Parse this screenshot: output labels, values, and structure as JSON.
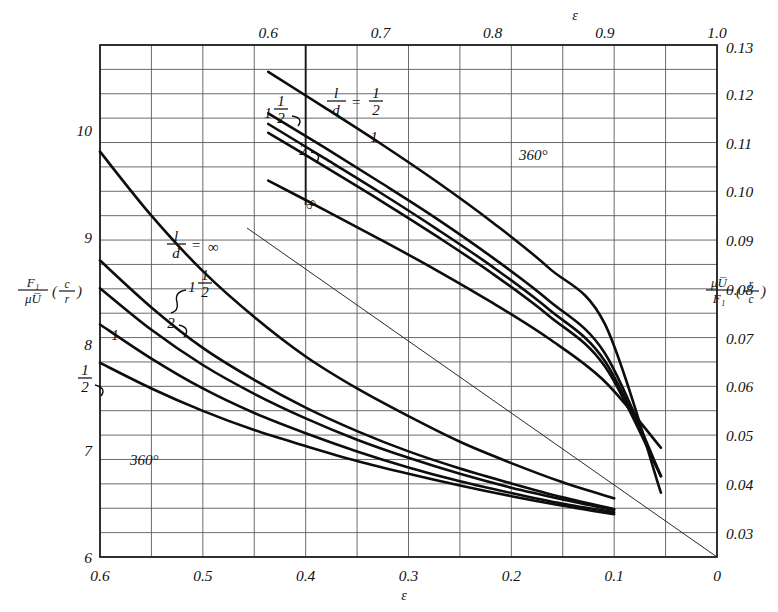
{
  "figure": {
    "kind": "engineering-chart",
    "background": "#ffffff",
    "ink_color": "#1a1a1a"
  },
  "axes": {
    "bottom": {
      "name": "epsilon",
      "symbol": "ε",
      "ticks": [
        "0.6",
        "0.5",
        "0.4",
        "0.3",
        "0.2",
        "0.1",
        "0"
      ],
      "values": [
        0.6,
        0.5,
        0.4,
        0.3,
        0.2,
        0.1,
        0.0
      ],
      "range": [
        0.6,
        0.0
      ],
      "reversed": true
    },
    "top": {
      "name": "epsilon",
      "symbol": "ε",
      "ticks": [
        "0.6",
        "0.7",
        "0.8",
        "0.9",
        "1.0"
      ],
      "values": [
        0.6,
        0.7,
        0.8,
        0.9,
        1.0
      ],
      "range": [
        0.45,
        1.0
      ]
    },
    "left": {
      "label_numerator": "F₁",
      "label_denominator": "μU̅",
      "label_paren_num": "c",
      "label_paren_den": "r",
      "ticks": [
        "10",
        "9",
        "8",
        "7",
        "6"
      ],
      "values": [
        10,
        9,
        8,
        7,
        6
      ],
      "range": [
        6,
        10.8
      ]
    },
    "right": {
      "label_numerator": "μU̅",
      "label_denominator": "F₁",
      "label_paren_num": "r",
      "label_paren_den": "c",
      "ticks": [
        "0.13",
        "0.12",
        "0.11",
        "0.10",
        "0.09",
        "0.08",
        "0.07",
        "0.06",
        "0.05",
        "0.04",
        "0.03"
      ],
      "values": [
        0.13,
        0.12,
        0.11,
        0.1,
        0.09,
        0.08,
        0.07,
        0.06,
        0.05,
        0.04,
        0.03
      ],
      "range": [
        0.13,
        0.025
      ]
    }
  },
  "annotations": {
    "upper_region_degrees": "360°",
    "lower_region_degrees": "360°",
    "upper_ld_equals": "= ",
    "lower_ld_equals": "= "
  },
  "curve_labels": {
    "ld_symbol_num": "l",
    "ld_symbol_den": "d",
    "upper": [
      {
        "id": "upper-half",
        "text": "½",
        "display": "1/2",
        "leader": true
      },
      {
        "id": "upper-one",
        "text": "1",
        "display": "1",
        "leader": false
      },
      {
        "id": "upper-onehalf",
        "text": "1½",
        "display": "1 1/2",
        "leader": true
      },
      {
        "id": "upper-two",
        "text": "2",
        "display": "2",
        "leader": true
      },
      {
        "id": "upper-inf",
        "text": "∞",
        "display": "∞",
        "leader": false
      }
    ],
    "lower": [
      {
        "id": "lower-inf",
        "text": "∞",
        "display": "∞",
        "leader": true
      },
      {
        "id": "lower-onehalf",
        "text": "1½",
        "display": "1 1/2",
        "leader": true
      },
      {
        "id": "lower-two",
        "text": "2",
        "display": "2",
        "leader": true
      },
      {
        "id": "lower-one",
        "text": "1",
        "display": "1",
        "leader": false
      },
      {
        "id": "lower-half",
        "text": "½",
        "display": "1/2",
        "leader": true
      }
    ]
  },
  "chart_data": {
    "type": "line",
    "title": "",
    "subtitle": "",
    "xlabel": "ε",
    "ylabel": "F₁/(μU̅)(c/r)",
    "y2label": "μU̅/F₁(r/c)",
    "grid": true,
    "legend": "inline-curve-labels",
    "note": "Full journal bearing (360°) friction variable vs eccentricity ratio; lower family uses bottom axis 0.6->0 with left scale, upper family uses top axis 0.6->1.0 with right scale.",
    "xlim_bottom": [
      0.6,
      0.0
    ],
    "xlim_top": [
      0.45,
      1.0
    ],
    "ylim_left": [
      6.0,
      10.8
    ],
    "ylim_right": [
      0.025,
      0.13
    ],
    "panels": [
      {
        "name": "lower-family",
        "x_axis": "bottom",
        "y_axis": "left",
        "x": [
          0.6,
          0.55,
          0.5,
          0.45,
          0.4,
          0.35,
          0.3,
          0.25,
          0.2,
          0.15,
          0.1
        ],
        "series": [
          {
            "name": "l/d = ∞",
            "label": "∞",
            "values": [
              9.8,
              9.2,
              8.68,
              8.25,
              7.88,
              7.58,
              7.32,
              7.08,
              6.88,
              6.7,
              6.55
            ]
          },
          {
            "name": "l/d = 1 1/2",
            "label": "1½",
            "values": [
              8.78,
              8.34,
              7.96,
              7.66,
              7.4,
              7.18,
              6.99,
              6.83,
              6.69,
              6.56,
              6.45
            ]
          },
          {
            "name": "l/d = 2",
            "label": "2",
            "values": [
              8.52,
              8.13,
              7.8,
              7.53,
              7.3,
              7.1,
              6.93,
              6.78,
              6.65,
              6.54,
              6.44
            ]
          },
          {
            "name": "l/d = 1",
            "label": "1",
            "values": [
              8.18,
              7.86,
              7.58,
              7.35,
              7.16,
              6.99,
              6.84,
              6.71,
              6.6,
              6.5,
              6.42
            ]
          },
          {
            "name": "l/d = 1/2",
            "label": "½",
            "values": [
              7.82,
              7.58,
              7.37,
              7.19,
              7.04,
              6.9,
              6.78,
              6.67,
              6.57,
              6.48,
              6.4
            ]
          }
        ]
      },
      {
        "name": "upper-family",
        "x_axis": "top",
        "y_axis": "right",
        "x": [
          0.6,
          0.65,
          0.7,
          0.75,
          0.8,
          0.85,
          0.9,
          0.95
        ],
        "series": [
          {
            "name": "l/d = 1/2",
            "label": "½",
            "values": [
              0.1245,
              0.1172,
              0.1098,
              0.102,
              0.0936,
              0.0843,
              0.0728,
              0.0382
            ]
          },
          {
            "name": "l/d = 1",
            "label": "1",
            "values": [
              0.116,
              0.109,
              0.1018,
              0.0944,
              0.0864,
              0.0776,
              0.0668,
              0.0416
            ]
          },
          {
            "name": "l/d = 1 1/2",
            "label": "1½",
            "values": [
              0.1138,
              0.1068,
              0.0997,
              0.0923,
              0.0845,
              0.0758,
              0.0652,
              0.0416
            ]
          },
          {
            "name": "l/d = 2",
            "label": "2",
            "values": [
              0.112,
              0.1051,
              0.0981,
              0.0908,
              0.0831,
              0.0745,
              0.0641,
              0.0416
            ]
          },
          {
            "name": "l/d = ∞",
            "label": "∞",
            "values": [
              0.1022,
              0.0962,
              0.0901,
              0.0838,
              0.0771,
              0.0698,
              0.061,
              0.0474
            ]
          }
        ]
      }
    ],
    "reference_line": {
      "name": "diagonal-reference-line",
      "from": {
        "x_px": 247,
        "y_px": 228
      },
      "to": {
        "x_px": 717,
        "y_px": 557
      },
      "style": "thin-straight"
    }
  }
}
